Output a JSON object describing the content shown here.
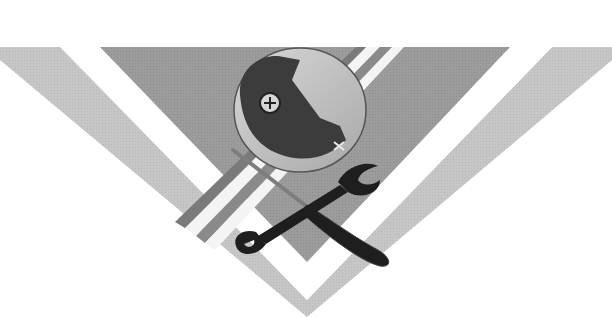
{
  "image": {
    "description": "Grayscale emblem: inverted chevron/triangle with crossed wrench and screwdriver over a round piece of equipment",
    "colors": {
      "background": "#ffffff",
      "outer_band": "#c4c4c4",
      "inner_triangle": "#9a9a9a",
      "stripe_dark": "#8a8a8a",
      "stripe_light": "#f2f2f2",
      "disc_light": "#bdbdbd",
      "disc_dark": "#3c3c3c",
      "tool_dark": "#1e1e1e"
    },
    "elements": [
      {
        "name": "outer-chevron-band"
      },
      {
        "name": "inner-triangle"
      },
      {
        "name": "diagonal-stripes"
      },
      {
        "name": "round-device"
      },
      {
        "name": "wrench"
      },
      {
        "name": "screwdriver"
      }
    ]
  }
}
